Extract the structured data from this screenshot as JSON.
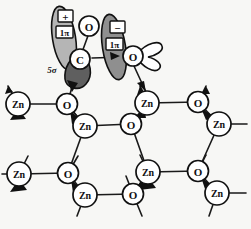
{
  "figure": {
    "background_color": "#f7f7f5",
    "bond_color": "#1a1a1a",
    "atom_fill": "#ffffff",
    "atom_stroke": "#111111",
    "orbital_light_fill": "#b3b3b3",
    "orbital_dark_fill": "#8a8a8a",
    "orbital_solid_fill": "#6e6e6e",
    "lonepair_fill": "#ffffff"
  },
  "molecule": {
    "label_O_top": "O",
    "label_C": "C",
    "label_O_right": "O"
  },
  "orbitals": {
    "left_lobe": {
      "sign": "+",
      "name": "1π"
    },
    "right_lobe": {
      "sign": "−",
      "name": "1π"
    },
    "sigma": {
      "name": "5σ"
    }
  },
  "lattice": {
    "atoms": [
      {
        "element": "Zn",
        "x": 18,
        "y": 104
      },
      {
        "element": "O",
        "x": 67,
        "y": 104
      },
      {
        "element": "Zn",
        "x": 85,
        "y": 126
      },
      {
        "element": "O",
        "x": 131,
        "y": 124
      },
      {
        "element": "Zn",
        "x": 147,
        "y": 103
      },
      {
        "element": "O",
        "x": 198,
        "y": 102
      },
      {
        "element": "Zn",
        "x": 219,
        "y": 124
      },
      {
        "element": "Zn",
        "x": 19,
        "y": 174
      },
      {
        "element": "O",
        "x": 68,
        "y": 173
      },
      {
        "element": "Zn",
        "x": 85,
        "y": 195
      },
      {
        "element": "O",
        "x": 133,
        "y": 194
      },
      {
        "element": "Zn",
        "x": 148,
        "y": 172
      },
      {
        "element": "O",
        "x": 198,
        "y": 171
      },
      {
        "element": "Zn",
        "x": 217,
        "y": 193
      }
    ],
    "element_labels": {
      "zinc": "Zn",
      "oxygen": "O"
    }
  }
}
